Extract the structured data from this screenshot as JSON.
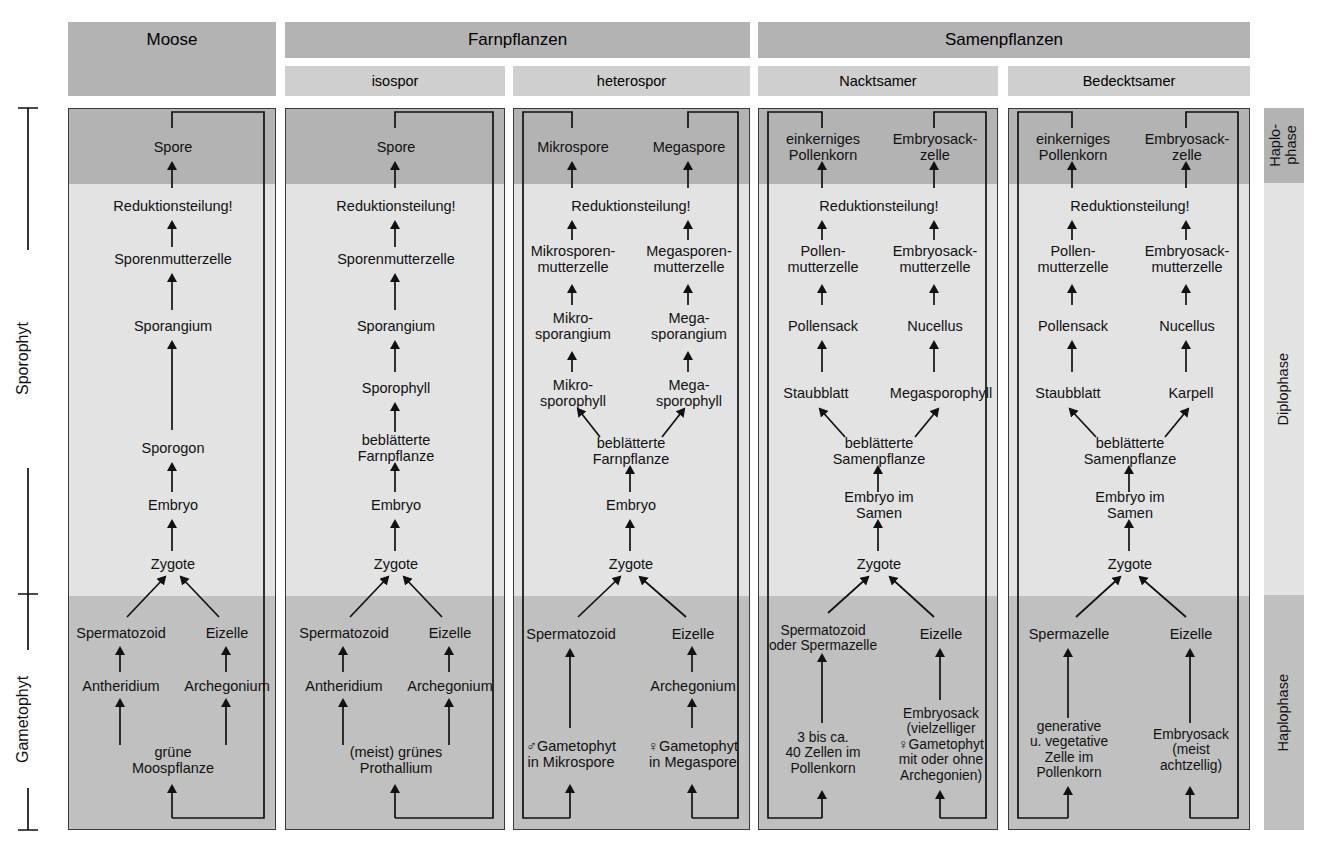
{
  "groups": [
    {
      "label": "Moose",
      "x": 68,
      "w": 208
    },
    {
      "label": "Farnpflanzen",
      "x": 285,
      "w": 465
    },
    {
      "label": "Samenpflanzen",
      "x": 758,
      "w": 492
    }
  ],
  "subgroups": [
    {
      "label": "isospor",
      "x": 285,
      "w": 220
    },
    {
      "label": "heterospor",
      "x": 513,
      "w": 237
    },
    {
      "label": "Nacktsamer",
      "x": 758,
      "w": 240
    },
    {
      "label": "Bedecktsamer",
      "x": 1008,
      "w": 242
    }
  ],
  "left_brackets": [
    {
      "label": "Sporophyt"
    },
    {
      "label": "Gametophyt"
    }
  ],
  "phases": [
    {
      "label": "Haplo-\nphase"
    },
    {
      "label": "Diplophase"
    },
    {
      "label": "Haplophase"
    }
  ],
  "columns": [
    {
      "name": "moose",
      "nodes": [
        {
          "text": "Spore",
          "cx": 172,
          "cy": 146
        },
        {
          "text": "Reduktionsteilung!",
          "cx": 172,
          "cy": 205
        },
        {
          "text": "Sporenmutterzelle",
          "cx": 172,
          "cy": 258
        },
        {
          "text": "Sporangium",
          "cx": 172,
          "cy": 325
        },
        {
          "text": "Sporogon",
          "cx": 172,
          "cy": 447
        },
        {
          "text": "Embryo",
          "cx": 172,
          "cy": 504
        },
        {
          "text": "Zygote",
          "cx": 172,
          "cy": 563
        },
        {
          "text": "Spermatozoid",
          "cx": 120,
          "cy": 632
        },
        {
          "text": "Eizelle",
          "cx": 226,
          "cy": 632
        },
        {
          "text": "Antheridium",
          "cx": 120,
          "cy": 685
        },
        {
          "text": "Archegonium",
          "cx": 226,
          "cy": 685
        },
        {
          "text": "grüne Moospflanze",
          "cx": 172,
          "cy": 759
        }
      ]
    },
    {
      "name": "isospor",
      "nodes": [
        {
          "text": "Spore",
          "cx": 395,
          "cy": 146
        },
        {
          "text": "Reduktionsteilung!",
          "cx": 395,
          "cy": 205
        },
        {
          "text": "Sporenmutterzelle",
          "cx": 395,
          "cy": 258
        },
        {
          "text": "Sporangium",
          "cx": 395,
          "cy": 325
        },
        {
          "text": "Sporophyll",
          "cx": 395,
          "cy": 387
        },
        {
          "text": "beblätterte Farnpflanze",
          "cx": 395,
          "cy": 447
        },
        {
          "text": "Embryo",
          "cx": 395,
          "cy": 504
        },
        {
          "text": "Zygote",
          "cx": 395,
          "cy": 563
        },
        {
          "text": "Spermatozoid",
          "cx": 343,
          "cy": 632
        },
        {
          "text": "Eizelle",
          "cx": 449,
          "cy": 632
        },
        {
          "text": "Antheridium",
          "cx": 343,
          "cy": 685
        },
        {
          "text": "Archegonium",
          "cx": 449,
          "cy": 685
        },
        {
          "text": "(meist) grünes Prothallium",
          "cx": 395,
          "cy": 759
        }
      ]
    },
    {
      "name": "heterospor",
      "nodes": [
        {
          "text": "Mikrospore",
          "cx": 572,
          "cy": 146
        },
        {
          "text": "Megaspore",
          "cx": 688,
          "cy": 146
        },
        {
          "text": "Reduktionsteilung!",
          "cx": 630,
          "cy": 205
        },
        {
          "text": "Mikrosporen-\nmutterzelle",
          "cx": 572,
          "cy": 258
        },
        {
          "text": "Megasporen-\nmutterzelle",
          "cx": 688,
          "cy": 258
        },
        {
          "text": "Mikro-\nsporangium",
          "cx": 572,
          "cy": 325
        },
        {
          "text": "Mega-\nsporangium",
          "cx": 688,
          "cy": 325
        },
        {
          "text": "Mikro-\nsporophyll",
          "cx": 572,
          "cy": 392
        },
        {
          "text": "Mega-\nsporophyll",
          "cx": 688,
          "cy": 392
        },
        {
          "text": "beblätterte Farnpflanze",
          "cx": 630,
          "cy": 450
        },
        {
          "text": "Embryo",
          "cx": 630,
          "cy": 504
        },
        {
          "text": "Zygote",
          "cx": 630,
          "cy": 563
        },
        {
          "text": "Spermatozoid",
          "cx": 570,
          "cy": 633
        },
        {
          "text": "Eizelle",
          "cx": 692,
          "cy": 633
        },
        {
          "text": "Archegonium",
          "cx": 692,
          "cy": 685
        },
        {
          "text": "♂Gametophyt\nin Mikrospore",
          "cx": 570,
          "cy": 753
        },
        {
          "text": "♀Gametophyt\nin Megaspore",
          "cx": 692,
          "cy": 753
        }
      ]
    },
    {
      "name": "nacktsamer",
      "nodes": [
        {
          "text": "einkerniges\nPollenkorn",
          "cx": 822,
          "cy": 146
        },
        {
          "text": "Embryosack-\nzelle",
          "cx": 934,
          "cy": 146
        },
        {
          "text": "Reduktionsteilung!",
          "cx": 878,
          "cy": 205
        },
        {
          "text": "Pollen-\nmutterzelle",
          "cx": 822,
          "cy": 258
        },
        {
          "text": "Embryosack-\nmutterzelle",
          "cx": 934,
          "cy": 258
        },
        {
          "text": "Pollensack",
          "cx": 822,
          "cy": 325
        },
        {
          "text": "Nucellus",
          "cx": 934,
          "cy": 325
        },
        {
          "text": "Staubblatt",
          "cx": 815,
          "cy": 392
        },
        {
          "text": "Megasporophyll",
          "cx": 940,
          "cy": 392
        },
        {
          "text": "beblätterte Samenpflanze",
          "cx": 878,
          "cy": 450
        },
        {
          "text": "Embryo im Samen",
          "cx": 878,
          "cy": 504
        },
        {
          "text": "Zygote",
          "cx": 878,
          "cy": 563
        },
        {
          "text": "Spermatozoid\noder Spermazelle",
          "cx": 822,
          "cy": 637
        },
        {
          "text": "Eizelle",
          "cx": 940,
          "cy": 633
        },
        {
          "text": "3 bis ca.\n40 Zellen im\nPollenkorn",
          "cx": 822,
          "cy": 752
        },
        {
          "text": "Embryosack\n(vielzelliger\n♀Gametophyt\nmit oder ohne\nArchegonien)",
          "cx": 940,
          "cy": 744
        }
      ]
    },
    {
      "name": "bedecktsamer",
      "nodes": [
        {
          "text": "einkerniges\nPollenkorn",
          "cx": 1072,
          "cy": 146
        },
        {
          "text": "Embryosack-\nzelle",
          "cx": 1186,
          "cy": 146
        },
        {
          "text": "Reduktionsteilung!",
          "cx": 1129,
          "cy": 205
        },
        {
          "text": "Pollen-\nmutterzelle",
          "cx": 1072,
          "cy": 258
        },
        {
          "text": "Embryosack-\nmutterzelle",
          "cx": 1186,
          "cy": 258
        },
        {
          "text": "Pollensack",
          "cx": 1072,
          "cy": 325
        },
        {
          "text": "Nucellus",
          "cx": 1186,
          "cy": 325
        },
        {
          "text": "Staubblatt",
          "cx": 1067,
          "cy": 392
        },
        {
          "text": "Karpell",
          "cx": 1190,
          "cy": 392
        },
        {
          "text": "beblätterte Samenpflanze",
          "cx": 1129,
          "cy": 450
        },
        {
          "text": "Embryo im Samen",
          "cx": 1129,
          "cy": 504
        },
        {
          "text": "Zygote",
          "cx": 1129,
          "cy": 563
        },
        {
          "text": "Spermazelle",
          "cx": 1068,
          "cy": 633
        },
        {
          "text": "Eizelle",
          "cx": 1190,
          "cy": 633
        },
        {
          "text": "generative\nu. vegetative\nZelle im\nPollenkorn",
          "cx": 1068,
          "cy": 749
        },
        {
          "text": "Embryosack\n(meist achtzellig)",
          "cx": 1190,
          "cy": 749
        }
      ]
    }
  ]
}
